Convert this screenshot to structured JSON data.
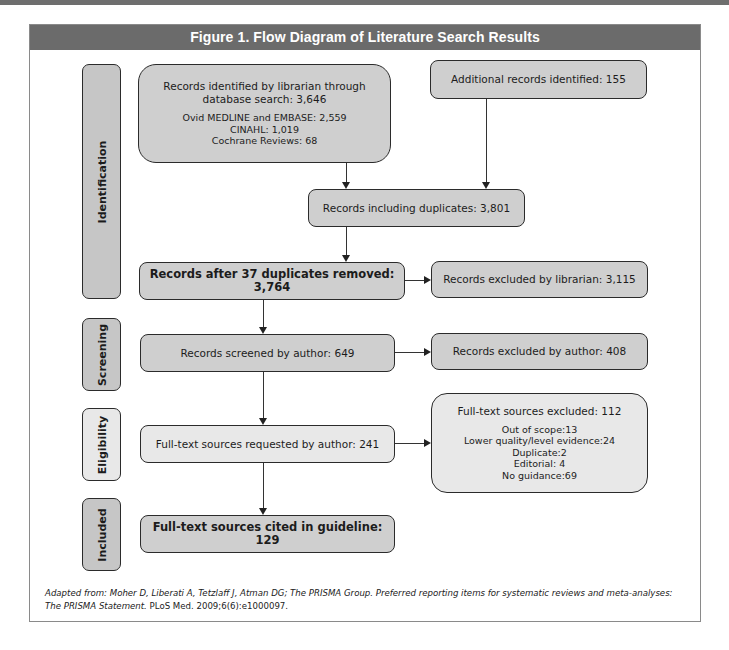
{
  "figure": {
    "title": "Figure 1.  Flow Diagram of Literature Search Results"
  },
  "phases": [
    {
      "label": "Identification"
    },
    {
      "label": "Screening"
    },
    {
      "label": "Eligibility"
    },
    {
      "label": "Included"
    }
  ],
  "boxes": {
    "database_search": {
      "title_line1": "Records identified by librarian through",
      "title_line2": "database search: 3,646",
      "details": [
        "Ovid MEDLINE and EMBASE: 2,559",
        "CINAHL: 1,019",
        "Cochrane Reviews: 68"
      ]
    },
    "additional": {
      "label": "Additional records identified: 155"
    },
    "including_duplicates": {
      "label": "Records including duplicates: 3,801"
    },
    "after_duplicates": {
      "label": "Records after 37 duplicates removed: 3,764"
    },
    "excluded_librarian": {
      "label": "Records excluded by librarian: 3,115"
    },
    "screened": {
      "label": "Records screened by author: 649"
    },
    "excluded_author": {
      "label": "Records excluded by author: 408"
    },
    "fulltext_requested": {
      "label": "Full-text sources requested by author: 241"
    },
    "fulltext_excluded": {
      "title": "Full-text sources excluded: 112",
      "details": [
        "Out of scope:13",
        "Lower quality/level evidence:24",
        "Duplicate:2",
        "Editorial: 4",
        "No guidance:69"
      ]
    },
    "cited": {
      "label": "Full-text sources cited in guideline: 129"
    }
  },
  "footnote": {
    "italic_part": "Adapted from: Moher D, Liberati A, Tetzlaff J, Atman DG; The PRISMA Group. Preferred reporting items for systematic reviews and meta-analyses: The PRISMA Statement.",
    "plain_part": " PLoS Med. 2009;6(6):e1000097."
  },
  "colors": {
    "header_bg": "#6b6b6b",
    "box_fill": "#cfcfcf",
    "box_fill_light": "#e8e8e8",
    "border": "#2b2b2b"
  }
}
